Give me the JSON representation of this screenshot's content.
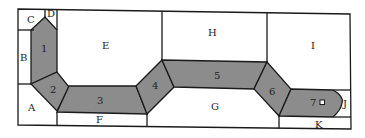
{
  "diagram": {
    "type": "floor-plan-corridor",
    "colors": {
      "background": "#ffffff",
      "line": "#1a1a1a",
      "corridor_fill": "#8c8c8c"
    },
    "regions": [
      {
        "id": "A",
        "label": "A"
      },
      {
        "id": "B",
        "label": "B"
      },
      {
        "id": "C",
        "label": "C"
      },
      {
        "id": "D",
        "label": "D"
      },
      {
        "id": "E",
        "label": "E"
      },
      {
        "id": "F",
        "label": "F"
      },
      {
        "id": "G",
        "label": "G"
      },
      {
        "id": "H",
        "label": "H"
      },
      {
        "id": "I",
        "label": "I"
      },
      {
        "id": "J",
        "label": "J"
      },
      {
        "id": "K",
        "label": "K"
      }
    ],
    "segments": [
      {
        "id": "1",
        "label": "1"
      },
      {
        "id": "2",
        "label": "2"
      },
      {
        "id": "3",
        "label": "3"
      },
      {
        "id": "4",
        "label": "4"
      },
      {
        "id": "5",
        "label": "5"
      },
      {
        "id": "6",
        "label": "6"
      },
      {
        "id": "7",
        "label": "7"
      }
    ],
    "marker": {
      "type": "small-square",
      "in_segment": "7"
    }
  }
}
